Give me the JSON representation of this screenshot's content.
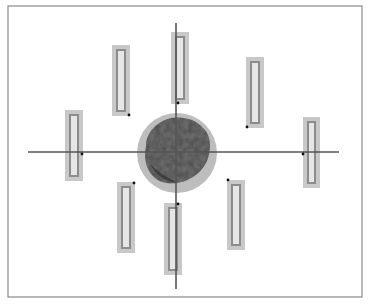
{
  "diagram": {
    "type": "radial-electrode-array-schematic",
    "frame": {
      "x": 8,
      "y": 6,
      "w": 354,
      "h": 291,
      "stroke": "#8a8a8a"
    },
    "axes": {
      "horizontal": {
        "x1": 28,
        "x2": 339,
        "y": 152
      },
      "vertical": {
        "x": 176,
        "y1": 23,
        "y2": 289
      },
      "color": "#555555"
    },
    "center_object": {
      "label": "irregular central body",
      "halo": {
        "cx": 177,
        "cy": 153,
        "r": 40,
        "color": "#bdbdbd"
      },
      "body_color": "#4a4a4a"
    },
    "bars": [
      {
        "id": "top-left",
        "x": 112,
        "y": 45,
        "w": 18,
        "h": 71,
        "dot": {
          "x": 129,
          "y": 115
        }
      },
      {
        "id": "top-center",
        "x": 171,
        "y": 32,
        "w": 18,
        "h": 72,
        "dot": {
          "x": 178,
          "y": 103
        }
      },
      {
        "id": "top-right",
        "x": 246,
        "y": 57,
        "w": 18,
        "h": 71,
        "dot": {
          "x": 247,
          "y": 127
        }
      },
      {
        "id": "left",
        "x": 65,
        "y": 110,
        "w": 18,
        "h": 71,
        "dot": {
          "x": 82,
          "y": 154
        }
      },
      {
        "id": "right",
        "x": 303,
        "y": 117,
        "w": 17,
        "h": 71,
        "dot": {
          "x": 303,
          "y": 154
        }
      },
      {
        "id": "bottom-left",
        "x": 117,
        "y": 182,
        "w": 18,
        "h": 71,
        "dot": {
          "x": 134,
          "y": 183
        }
      },
      {
        "id": "bottom-center",
        "x": 164,
        "y": 203,
        "w": 18,
        "h": 72,
        "dot": {
          "x": 178,
          "y": 204
        }
      },
      {
        "id": "bottom-right",
        "x": 227,
        "y": 180,
        "w": 18,
        "h": 70,
        "dot": {
          "x": 228,
          "y": 180
        }
      }
    ],
    "colors": {
      "bar_fill": "#c8c8c8",
      "bar_inner_stroke": "#8c8c8c",
      "bar_inner_fill": "#e6e6e6",
      "dot": "#111111"
    }
  }
}
